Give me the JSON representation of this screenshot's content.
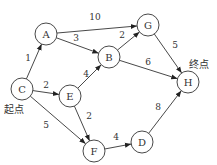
{
  "diagram": {
    "type": "directed-weighted-graph",
    "start_label": "起点",
    "end_label": "终点",
    "nodes": [
      {
        "id": "A",
        "label": "A",
        "x": 46,
        "y": 34
      },
      {
        "id": "B",
        "label": "B",
        "x": 109,
        "y": 57
      },
      {
        "id": "G",
        "label": "G",
        "x": 148,
        "y": 25
      },
      {
        "id": "H",
        "label": "H",
        "x": 188,
        "y": 82
      },
      {
        "id": "C",
        "label": "C",
        "x": 22,
        "y": 89
      },
      {
        "id": "E",
        "label": "E",
        "x": 70,
        "y": 96
      },
      {
        "id": "F",
        "label": "F",
        "x": 94,
        "y": 151
      },
      {
        "id": "D",
        "label": "D",
        "x": 142,
        "y": 142
      }
    ],
    "edges": [
      {
        "from": "C",
        "to": "A",
        "weight": "1",
        "lx": 28,
        "ly": 58
      },
      {
        "from": "A",
        "to": "G",
        "weight": "10",
        "lx": 95,
        "ly": 17
      },
      {
        "from": "A",
        "to": "B",
        "weight": "3",
        "lx": 76,
        "ly": 38
      },
      {
        "from": "B",
        "to": "G",
        "weight": "2",
        "lx": 122,
        "ly": 35
      },
      {
        "from": "G",
        "to": "H",
        "weight": "5",
        "lx": 175,
        "ly": 45
      },
      {
        "from": "B",
        "to": "H",
        "weight": "6",
        "lx": 148,
        "ly": 62
      },
      {
        "from": "C",
        "to": "E",
        "weight": "2",
        "lx": 46,
        "ly": 85
      },
      {
        "from": "E",
        "to": "B",
        "weight": "4",
        "lx": 86,
        "ly": 74
      },
      {
        "from": "C",
        "to": "F",
        "weight": "5",
        "lx": 46,
        "ly": 125
      },
      {
        "from": "E",
        "to": "F",
        "weight": "2",
        "lx": 89,
        "ly": 116
      },
      {
        "from": "F",
        "to": "D",
        "weight": "4",
        "lx": 116,
        "ly": 137
      },
      {
        "from": "D",
        "to": "H",
        "weight": "8",
        "lx": 158,
        "ly": 107
      }
    ]
  }
}
